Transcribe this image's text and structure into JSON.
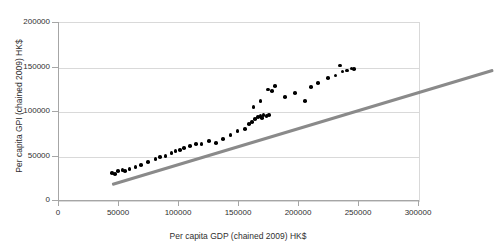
{
  "chart_data": {
    "type": "scatter",
    "title": "",
    "xlabel": "Per capita GDP (chained 2009) HK$",
    "ylabel": "Per capita GPI (chained 2009) HK$",
    "xlim": [
      0,
      300000
    ],
    "ylim": [
      0,
      200000
    ],
    "xticks": [
      0,
      50000,
      100000,
      150000,
      200000,
      250000,
      300000
    ],
    "yticks": [
      0,
      50000,
      100000,
      150000,
      200000
    ],
    "xtick_labels": [
      "0",
      "50000",
      "100000",
      "150000",
      "200000",
      "250000",
      "300000"
    ],
    "ytick_labels": [
      "0",
      "50000",
      "100000",
      "150000",
      "200000"
    ],
    "grid": true,
    "legend": false,
    "marker_color": "#000000",
    "trendline_color": "#8a8a8a",
    "gridline_color": "#d9d9d9",
    "axis_color": "#a6a6a6",
    "points": [
      [
        44400,
        31500
      ],
      [
        46800,
        30400
      ],
      [
        49200,
        33700
      ],
      [
        52800,
        34800
      ],
      [
        55200,
        33700
      ],
      [
        58800,
        36000
      ],
      [
        63600,
        38200
      ],
      [
        68400,
        40500
      ],
      [
        74400,
        43900
      ],
      [
        80400,
        47300
      ],
      [
        84000,
        49500
      ],
      [
        88800,
        50600
      ],
      [
        93600,
        53900
      ],
      [
        97200,
        56200
      ],
      [
        100800,
        57300
      ],
      [
        104400,
        59600
      ],
      [
        109200,
        61800
      ],
      [
        114000,
        64100
      ],
      [
        118800,
        64100
      ],
      [
        124800,
        67400
      ],
      [
        130800,
        65200
      ],
      [
        136800,
        69600
      ],
      [
        142800,
        74100
      ],
      [
        148800,
        78600
      ],
      [
        154800,
        80800
      ],
      [
        158400,
        86400
      ],
      [
        160800,
        88600
      ],
      [
        163200,
        91900
      ],
      [
        165600,
        94200
      ],
      [
        168000,
        95300
      ],
      [
        169200,
        93100
      ],
      [
        170400,
        96400
      ],
      [
        172800,
        95300
      ],
      [
        175200,
        96400
      ],
      [
        162000,
        105400
      ],
      [
        168000,
        112100
      ],
      [
        174000,
        125500
      ],
      [
        177600,
        123300
      ],
      [
        180000,
        128900
      ],
      [
        188400,
        116600
      ],
      [
        196800,
        121100
      ],
      [
        205200,
        112100
      ],
      [
        210000,
        127800
      ],
      [
        216000,
        132300
      ],
      [
        224400,
        137900
      ],
      [
        230400,
        141200
      ],
      [
        234000,
        152400
      ],
      [
        236400,
        145700
      ],
      [
        240000,
        146800
      ],
      [
        243600,
        149000
      ],
      [
        246000,
        148000
      ]
    ],
    "trendline": {
      "x_start": 44400,
      "y_start": 20200,
      "x_end": 362000,
      "y_end": 148500
    }
  }
}
